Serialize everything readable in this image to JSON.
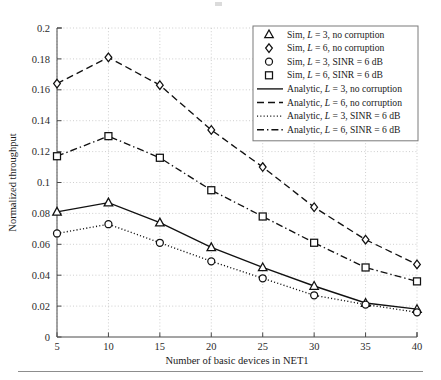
{
  "figure": {
    "background": "#ffffff",
    "line_color": "#111111",
    "grid_color": "#b9b9b9",
    "axis_color": "#4a4a4a"
  },
  "axes": {
    "xlabel": "Number of basic devices in NET1",
    "ylabel": "Normalized throughput",
    "x_ticks": [
      "5",
      "10",
      "15",
      "20",
      "25",
      "30",
      "35",
      "40"
    ],
    "y_ticks": [
      "0",
      "0.02",
      "0.04",
      "0.06",
      "0.08",
      "0.1",
      "0.12",
      "0.14",
      "0.16",
      "0.18",
      "0.2"
    ]
  },
  "legend": {
    "position": "top-right",
    "entries": [
      {
        "label": "Sim, L = 3, no corruption",
        "prefix": "Sim, ",
        "italic": "L",
        "suffix": " = 3, no corruption",
        "style": "marker",
        "marker": "triangle-up"
      },
      {
        "label": "Sim, L = 6, no corruption",
        "prefix": "Sim, ",
        "italic": "L",
        "suffix": " = 6, no corruption",
        "style": "marker",
        "marker": "diamond"
      },
      {
        "label": "Sim, L = 3, SINR = 6 dB",
        "prefix": "Sim, ",
        "italic": "L",
        "suffix": " = 3, SINR = 6 dB",
        "style": "marker",
        "marker": "circle"
      },
      {
        "label": "Sim, L = 6, SINR = 6 dB",
        "prefix": "Sim, ",
        "italic": "L",
        "suffix": " = 6, SINR = 6 dB",
        "style": "marker",
        "marker": "square"
      },
      {
        "label": "Analytic, L = 3, no corruption",
        "prefix": "Analytic, ",
        "italic": "L",
        "suffix": " = 3, no corruption",
        "style": "line",
        "line": "solid"
      },
      {
        "label": "Analytic, L = 6, no corruption",
        "prefix": "Analytic, ",
        "italic": "L",
        "suffix": " = 6, no corruption",
        "style": "line",
        "line": "dashed"
      },
      {
        "label": "Analytic, L = 3, SINR = 6 dB",
        "prefix": "Analytic, ",
        "italic": "L",
        "suffix": " = 3, SINR = 6 dB",
        "style": "line",
        "line": "dotted"
      },
      {
        "label": "Analytic, L = 6, SINR = 6 dB",
        "prefix": "Analytic, ",
        "italic": "L",
        "suffix": " = 6, SINR = 6 dB",
        "style": "line",
        "line": "dashdot"
      }
    ]
  },
  "chart_data": {
    "type": "line",
    "title": "",
    "xlabel": "Number of basic devices in NET1",
    "ylabel": "Normalized throughput",
    "x": [
      5,
      10,
      15,
      20,
      25,
      30,
      35,
      40
    ],
    "xlim": [
      5,
      40
    ],
    "ylim": [
      0,
      0.2
    ],
    "grid": true,
    "legend_position": "top-right",
    "series": [
      {
        "name": "Analytic, L = 6, no corruption",
        "marker": "diamond",
        "line": "dashed",
        "sim_name": "Sim, L = 6, no corruption",
        "values": [
          0.164,
          0.181,
          0.163,
          0.134,
          0.11,
          0.084,
          0.063,
          0.047
        ]
      },
      {
        "name": "Analytic, L = 6, SINR = 6 dB",
        "marker": "square",
        "line": "dashdot",
        "sim_name": "Sim, L = 6, SINR = 6 dB",
        "values": [
          0.117,
          0.13,
          0.116,
          0.095,
          0.078,
          0.061,
          0.045,
          0.036
        ]
      },
      {
        "name": "Analytic, L = 3, no corruption",
        "marker": "triangle-up",
        "line": "solid",
        "sim_name": "Sim, L = 3, no corruption",
        "values": [
          0.081,
          0.087,
          0.074,
          0.058,
          0.045,
          0.033,
          0.022,
          0.018
        ]
      },
      {
        "name": "Analytic, L = 3, SINR = 6 dB",
        "marker": "circle",
        "line": "dotted",
        "sim_name": "Sim, L = 3, SINR = 6 dB",
        "values": [
          0.067,
          0.073,
          0.061,
          0.049,
          0.038,
          0.027,
          0.021,
          0.016
        ]
      }
    ]
  }
}
